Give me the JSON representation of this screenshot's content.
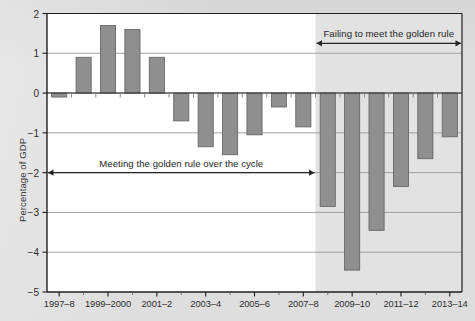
{
  "chart_data": {
    "type": "bar",
    "title": "",
    "xlabel": "",
    "ylabel": "Percentage of GDP",
    "ylim": [
      -5,
      2
    ],
    "ytick_values": [
      2,
      1,
      0,
      -1,
      -2,
      -3,
      -4,
      -5
    ],
    "ytick_labels": [
      "2",
      "1",
      "0",
      "−1",
      "−2",
      "−3",
      "−4",
      "−5"
    ],
    "grid": true,
    "legend": "none",
    "categories": [
      "1997–8",
      "1998–9",
      "1999–2000",
      "2000–1",
      "2001–2",
      "2002–3",
      "2003–4",
      "2004–5",
      "2005–6",
      "2006–7",
      "2007–8",
      "2008–9",
      "2009–10",
      "2010–11",
      "2011–12",
      "2012–13",
      "2013–14"
    ],
    "xtick_labels": [
      "1997–8",
      "1999–2000",
      "2001–2",
      "2003–4",
      "2005–6",
      "2007–8",
      "2009–10",
      "2011–12",
      "2013–14"
    ],
    "xtick_category_index": [
      0,
      2,
      4,
      6,
      8,
      10,
      12,
      14,
      16
    ],
    "values": [
      -0.1,
      0.9,
      1.7,
      1.6,
      0.9,
      -0.7,
      -1.35,
      -1.55,
      -1.05,
      -0.35,
      -0.85,
      -2.85,
      -4.45,
      -3.45,
      -2.35,
      -1.65,
      -1.1
    ],
    "bar_color": "#8f8f8f",
    "bar_edge_color": "#5f5f5f",
    "gridline_color": "#9a9a9a",
    "axis_color": "#1f1f1f",
    "plot_bg_color": "#ffffff",
    "shaded_region": {
      "label": "forecast / post-crisis shading",
      "from_category_index": 11,
      "color": "#e2e2e2"
    },
    "annotations": [
      {
        "id": "failing",
        "text": "Failing to meet the golden rule",
        "from_category_index": 11,
        "to_category_index": 16,
        "value_y": 1.25,
        "arrow": "double"
      },
      {
        "id": "meeting",
        "text": "Meeting the golden rule over the cycle",
        "from_category_index": 0,
        "to_category_index": 10,
        "value_y": -2.0,
        "arrow": "double"
      }
    ]
  }
}
